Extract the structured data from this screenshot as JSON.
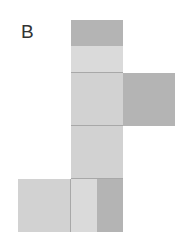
{
  "figure": {
    "label": "B",
    "colors": {
      "light": "#d2d2d2",
      "lighter": "#dadada",
      "dark": "#b4b4b4",
      "edge": "#a8a8a8"
    }
  }
}
